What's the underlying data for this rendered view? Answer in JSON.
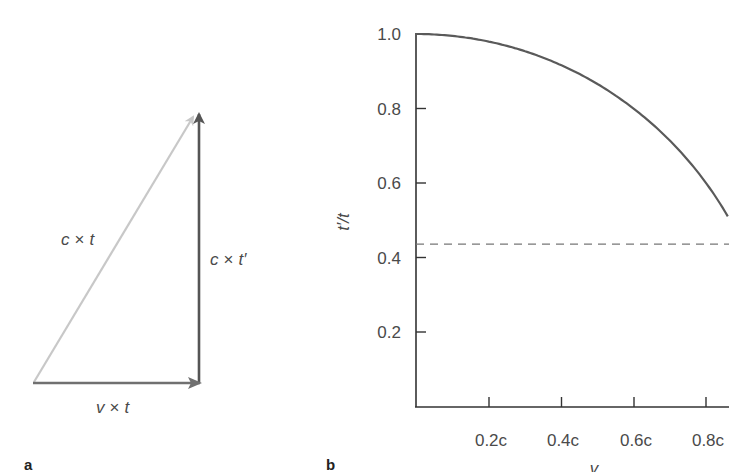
{
  "panel_a": {
    "label": "a",
    "hypotenuse_label": {
      "var": "c",
      "op": "×",
      "var2": "t"
    },
    "vertical_label": {
      "var": "c",
      "op": "×",
      "var2": "t′"
    },
    "horizontal_label": {
      "var": "v",
      "op": "×",
      "var2": "t"
    },
    "colors": {
      "hypotenuse": "#c8c8c8",
      "vertical": "#555555",
      "horizontal": "#707070"
    }
  },
  "panel_b": {
    "label": "b"
  },
  "chart_data": {
    "type": "line",
    "title": "",
    "xlabel": "v",
    "ylabel": "t′/t",
    "x_ticks": [
      "0.2c",
      "0.4c",
      "0.6c",
      "0.8c"
    ],
    "x_tick_values": [
      0.2,
      0.4,
      0.6,
      0.8
    ],
    "y_ticks": [
      "0.2",
      "0.4",
      "0.6",
      "0.8",
      "1.0"
    ],
    "y_tick_values": [
      0.2,
      0.4,
      0.6,
      0.8,
      1.0
    ],
    "xlim": [
      0,
      0.86
    ],
    "ylim": [
      0,
      1.0
    ],
    "grid": false,
    "series": [
      {
        "name": "t′/t = √(1 − v²/c²)",
        "style": "solid",
        "color": "#5a5a5a",
        "x": [
          0,
          0.1,
          0.2,
          0.3,
          0.4,
          0.5,
          0.6,
          0.7,
          0.8,
          0.86
        ],
        "y": [
          1.0,
          0.995,
          0.98,
          0.954,
          0.917,
          0.866,
          0.8,
          0.714,
          0.6,
          0.51
        ]
      },
      {
        "name": "reference level",
        "style": "dashed",
        "color": "#777777",
        "x": [
          0,
          0.86
        ],
        "y": [
          0.436,
          0.436
        ]
      }
    ]
  }
}
